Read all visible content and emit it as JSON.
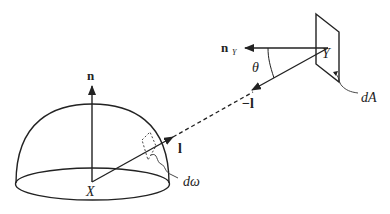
{
  "diagram": {
    "type": "radiometry-geometry",
    "labels": {
      "normal_x": "n",
      "normal_y": "n",
      "normal_y_sub": "Y",
      "theta": "θ",
      "point_y": "Y",
      "point_x": "X",
      "area": "dA",
      "dir_l": "l",
      "dir_neg_l": "−l",
      "solid_angle": "dω"
    },
    "colors": {
      "stroke": "#222222",
      "background": "#ffffff"
    }
  }
}
